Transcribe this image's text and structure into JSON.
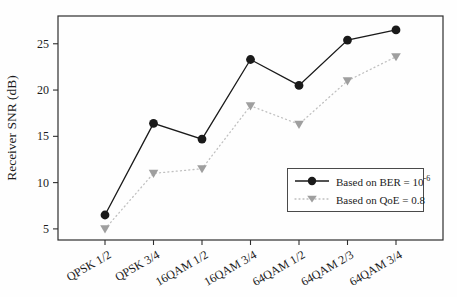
{
  "figure": {
    "background": "#fefefe",
    "frame_color": "#2e2e2e"
  },
  "chart_data": {
    "type": "line",
    "title": "",
    "xlabel": "",
    "ylabel": "Receiver SNR (dB)",
    "categories": [
      "QPSK 1/2",
      "QPSK 3/4",
      "16QAM 1/2",
      "16QAM 3/4",
      "64QAM 1/2",
      "64QAM 2/3",
      "64QAM 3/4"
    ],
    "series": [
      {
        "name": "Based on BER = 10⁻⁶",
        "legend_label": {
          "text": "Based on BER = 10",
          "sup": "-6"
        },
        "values": [
          6.5,
          16.4,
          14.7,
          23.3,
          20.5,
          25.4,
          26.5
        ],
        "color": "#1a1a1a",
        "line_color": "#1a1a1a",
        "line_style": "solid",
        "marker": "circle"
      },
      {
        "name": "Based on QoE = 0.8",
        "legend_label": {
          "text": "Based on QoE = 0.8",
          "sup": ""
        },
        "values": [
          5.0,
          11.0,
          11.5,
          18.3,
          16.3,
          21.0,
          23.6
        ],
        "color": "#9f9f9f",
        "line_color": "#c0c0c0",
        "line_style": "dotted",
        "marker": "triangle-down"
      }
    ],
    "yticks": [
      5,
      10,
      15,
      20,
      25
    ],
    "ylim": [
      3.8,
      28
    ],
    "grid": false,
    "legend_position": "lower-right"
  }
}
